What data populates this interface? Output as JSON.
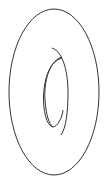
{
  "diagram": {
    "stroke_color": "#333333",
    "background": "#ffffff",
    "shapes": [
      {
        "name": "outer-ellipse",
        "cx": 54,
        "cy": 92,
        "rx": 45,
        "ry": 83
      },
      {
        "name": "inner-hole-left-arc"
      },
      {
        "name": "inner-hole-right-arc"
      }
    ]
  }
}
